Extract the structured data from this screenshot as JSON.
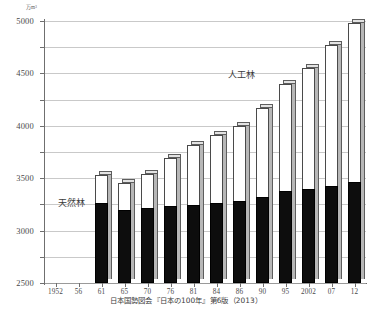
{
  "chart_data": {
    "type": "bar",
    "subtype": "stacked-bar-3d",
    "title": "",
    "xlabel": "",
    "ylabel": "",
    "yunit": "万m³",
    "ylim": [
      0,
      5000
    ],
    "ytick_step": 500,
    "yticks": [
      0,
      500,
      1000,
      1500,
      2000,
      2500,
      3000,
      3500,
      4000,
      4500,
      5000
    ],
    "ytick_labels": [
      "0",
      "500",
      "1000",
      "1500",
      "2000",
      "2500",
      "3000",
      "3500",
      "4000",
      "4500",
      "5000"
    ],
    "grid": true,
    "legend_position": "inline-annotation",
    "categories": [
      "1952",
      "56",
      "61",
      "65",
      "70",
      "76",
      "81",
      "84",
      "86",
      "90",
      "95",
      "2002",
      "07",
      "12"
    ],
    "series": [
      {
        "name": "天然林",
        "color": "#0d0d0d",
        "values": [
          0,
          0,
          1530,
          1400,
          1440,
          1470,
          1480,
          1520,
          1560,
          1640,
          1760,
          1790,
          1860,
          1930
        ]
      },
      {
        "name": "人工林",
        "color": "#ffffff",
        "values": [
          0,
          0,
          530,
          500,
          640,
          910,
          1150,
          1310,
          1430,
          1700,
          2030,
          2320,
          2680,
          3030
        ]
      }
    ],
    "totals": [
      0,
      0,
      2060,
      1900,
      2080,
      2380,
      2630,
      2830,
      2990,
      3340,
      3790,
      4110,
      4540,
      4960
    ],
    "annotations": [
      {
        "name": "natural-forest-label",
        "text": "天然林"
      },
      {
        "name": "planted-forest-label",
        "text": "人工林"
      }
    ]
  },
  "source": {
    "text": "日本国勢図会『日本の100年』第6版（2013）"
  }
}
